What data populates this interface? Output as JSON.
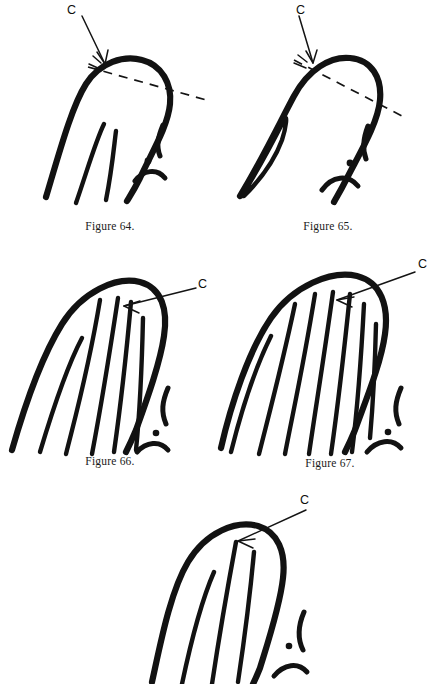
{
  "page": {
    "background_color": "#ffffff",
    "ink_color": "#121212",
    "width": 437,
    "height": 684
  },
  "figures": [
    {
      "id": "figure-64",
      "caption": "Figure 64.",
      "core_label": "C",
      "pattern_type": "loop",
      "has_dashed_line": true,
      "inner_ridge_count": 1,
      "has_delta": true,
      "description": "Recurving ridge with dashed line across shoulders; core at top of recurve"
    },
    {
      "id": "figure-65",
      "caption": "Figure 65.",
      "core_label": "C",
      "pattern_type": "loop",
      "has_dashed_line": true,
      "inner_ridge_count": 0,
      "has_enclosure": true,
      "has_delta": true,
      "description": "Recurving ridge with narrow enclosure on left limb; dashed line across shoulders"
    },
    {
      "id": "figure-66",
      "caption": "Figure 66.",
      "core_label": "C",
      "pattern_type": "loop",
      "has_dashed_line": false,
      "inner_ridge_count": 5,
      "has_delta": true,
      "description": "Loop with five rising inner ridges; core on innermost recurve"
    },
    {
      "id": "figure-67",
      "caption": "Figure 67.",
      "core_label": "C",
      "pattern_type": "loop",
      "has_dashed_line": false,
      "inner_ridge_count": 7,
      "has_delta": true,
      "description": "Loop with seven rising inner ridges; core on innermost recurve"
    },
    {
      "id": "figure-68",
      "caption": "",
      "core_label": "C",
      "pattern_type": "loop",
      "has_dashed_line": false,
      "inner_ridge_count": 3,
      "has_delta": true,
      "description": "Loop with three inner ridges, cropped at page edge; core on innermost recurve"
    }
  ]
}
